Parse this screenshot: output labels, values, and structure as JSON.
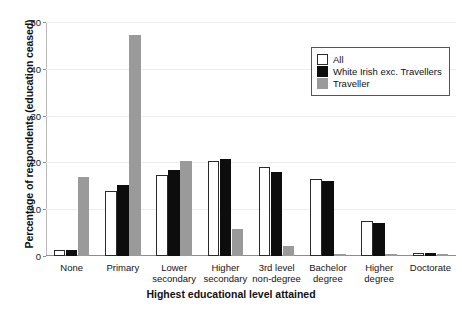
{
  "chart_data": {
    "type": "bar",
    "title": "",
    "xlabel": "Highest educational level attained",
    "ylabel": "Percentage of respondents (education ceased)",
    "categories": [
      "None",
      "Primary",
      "Lower secondary",
      "Higher secondary",
      "3rd level non-degree",
      "Bachelor degree",
      "Higher degree",
      "Doctorate"
    ],
    "category_lines": [
      [
        "None"
      ],
      [
        "Primary"
      ],
      [
        "Lower",
        "secondary"
      ],
      [
        "Higher",
        "secondary"
      ],
      [
        "3rd level",
        "non-degree"
      ],
      [
        "Bachelor",
        "degree"
      ],
      [
        "Higher",
        "degree"
      ],
      [
        "Doctorate"
      ]
    ],
    "series": [
      {
        "name": "All",
        "color": "#ffffff",
        "values": [
          1.3,
          13.8,
          17.4,
          20.2,
          19.0,
          16.4,
          7.5,
          0.6
        ]
      },
      {
        "name": "White Irish exc. Travellers",
        "color": "#0d0d0d",
        "values": [
          1.2,
          15.1,
          18.4,
          20.7,
          17.9,
          16.1,
          7.1,
          0.6
        ]
      },
      {
        "name": "Traveller",
        "color": "#9a9a9a",
        "values": [
          16.8,
          47.2,
          20.2,
          5.8,
          2.2,
          0.3,
          0.1,
          0.0
        ]
      }
    ],
    "ylim": [
      0,
      50
    ],
    "yticks": [
      0,
      10,
      20,
      30,
      40,
      50
    ],
    "ytick_labels": [
      "0",
      "10",
      "20",
      "30",
      "40",
      "50"
    ],
    "grid": "horizontal-light",
    "legend_position": "top-right"
  }
}
